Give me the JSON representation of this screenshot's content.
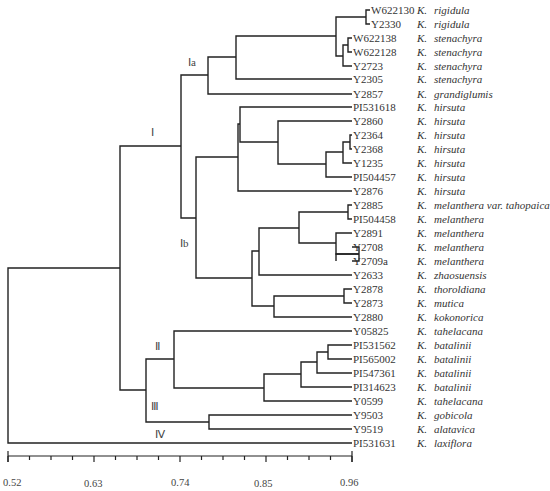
{
  "figure": {
    "type": "dendrogram",
    "axis": {
      "min": 0.52,
      "max": 0.96,
      "ticks": [
        "0.52",
        "0.63",
        "0.74",
        "0.85",
        "0.96"
      ],
      "minor_ticks_between": 3
    },
    "clade_labels": {
      "I": "Ⅰ",
      "Ia": "Ⅰa",
      "Ib": "Ⅰb",
      "II": "Ⅱ",
      "III": "Ⅲ",
      "IV": "Ⅳ"
    },
    "leaves": [
      {
        "id": "W622130",
        "genus": "K.",
        "species": "rigidula"
      },
      {
        "id": "Y2330",
        "genus": "K.",
        "species": "rigidula"
      },
      {
        "id": "W622138",
        "genus": "K.",
        "species": "stenachyra"
      },
      {
        "id": "W622128",
        "genus": "K.",
        "species": "stenachyra"
      },
      {
        "id": "Y2723",
        "genus": "K.",
        "species": "stenachyra"
      },
      {
        "id": "Y2305",
        "genus": "K.",
        "species": "stenachyra"
      },
      {
        "id": "Y2857",
        "genus": "K.",
        "species": "grandiglumis"
      },
      {
        "id": "PI531618",
        "genus": "K.",
        "species": "hirsuta"
      },
      {
        "id": "Y2860",
        "genus": "K.",
        "species": "hirsuta"
      },
      {
        "id": "Y2364",
        "genus": "K.",
        "species": "hirsuta"
      },
      {
        "id": "Y2368",
        "genus": "K.",
        "species": "hirsuta"
      },
      {
        "id": "Y1235",
        "genus": "K.",
        "species": "hirsuta"
      },
      {
        "id": "PI504457",
        "genus": "K.",
        "species": "hirsuta"
      },
      {
        "id": "Y2876",
        "genus": "K.",
        "species": "hirsuta"
      },
      {
        "id": "Y2885",
        "genus": "K.",
        "species": "melanthera var. tahopaica"
      },
      {
        "id": "PI504458",
        "genus": "K.",
        "species": "melanthera"
      },
      {
        "id": "Y2891",
        "genus": "K.",
        "species": "melanthera"
      },
      {
        "id": "Y2708",
        "genus": "K.",
        "species": "melanthera"
      },
      {
        "id": "Y2709a",
        "genus": "K.",
        "species": "melanthera"
      },
      {
        "id": "Y2633",
        "genus": "K.",
        "species": "zhaosuensis"
      },
      {
        "id": "Y2878",
        "genus": "K.",
        "species": "thoroldiana"
      },
      {
        "id": "Y2873",
        "genus": "K.",
        "species": "mutica"
      },
      {
        "id": "Y2880",
        "genus": "K.",
        "species": "kokonorica"
      },
      {
        "id": "Y05825",
        "genus": "K.",
        "species": "tahelacana"
      },
      {
        "id": "PI531562",
        "genus": "K.",
        "species": "batalinii"
      },
      {
        "id": "PI565002",
        "genus": "K.",
        "species": "batalinii"
      },
      {
        "id": "PI547361",
        "genus": "K.",
        "species": "batalinii"
      },
      {
        "id": "PI314623",
        "genus": "K.",
        "species": "batalinii"
      },
      {
        "id": "Y0599",
        "genus": "K.",
        "species": "tahelacana"
      },
      {
        "id": "Y9503",
        "genus": "K.",
        "species": "gobicola"
      },
      {
        "id": "Y9519",
        "genus": "K.",
        "species": "alatavica"
      },
      {
        "id": "PI531631",
        "genus": "K.",
        "species": "laxiflora"
      }
    ]
  }
}
